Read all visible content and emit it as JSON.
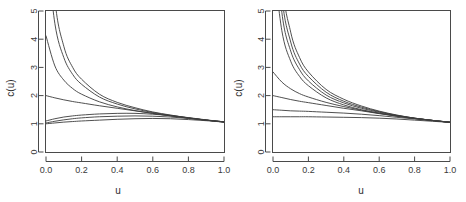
{
  "figure": {
    "background": "#ffffff",
    "curve_color": "#3c3c3c",
    "axis_color": "#4a4a4a",
    "panel_count": 2
  },
  "chart_data": [
    {
      "type": "line",
      "panel": "left",
      "title": "",
      "xlabel": "u",
      "ylabel": "c(u)",
      "xlim": [
        0.0,
        1.0
      ],
      "ylim": [
        0,
        5
      ],
      "xticks": [
        0.0,
        0.2,
        0.4,
        0.6,
        0.8,
        1.0
      ],
      "xticklabels": [
        "0.0",
        "0.2",
        "0.4",
        "0.6",
        "0.8",
        "1.0"
      ],
      "yticks": [
        0,
        1,
        2,
        3,
        4,
        5
      ],
      "yticklabels": [
        "0",
        "1",
        "2",
        "3",
        "4",
        "5"
      ],
      "grid": false,
      "legend": "none",
      "x": [
        0.0,
        0.05,
        0.1,
        0.15,
        0.2,
        0.3,
        0.4,
        0.5,
        0.6,
        0.7,
        0.8,
        0.9,
        1.0
      ],
      "series": [
        {
          "name": "curve-1",
          "values": [
            9.8,
            5.4,
            3.75,
            3.0,
            2.58,
            2.05,
            1.76,
            1.57,
            1.42,
            1.31,
            1.21,
            1.13,
            1.06
          ]
        },
        {
          "name": "curve-2",
          "values": [
            7.4,
            4.55,
            3.35,
            2.75,
            2.4,
            1.95,
            1.7,
            1.53,
            1.4,
            1.3,
            1.21,
            1.13,
            1.06
          ]
        },
        {
          "name": "curve-3",
          "values": [
            4.12,
            3.05,
            2.55,
            2.25,
            2.05,
            1.78,
            1.6,
            1.47,
            1.37,
            1.28,
            1.2,
            1.13,
            1.07
          ]
        },
        {
          "name": "curve-4",
          "values": [
            2.0,
            1.92,
            1.85,
            1.79,
            1.74,
            1.64,
            1.55,
            1.46,
            1.37,
            1.28,
            1.2,
            1.13,
            1.07
          ]
        },
        {
          "name": "curve-5",
          "values": [
            1.1,
            1.18,
            1.24,
            1.28,
            1.31,
            1.35,
            1.37,
            1.37,
            1.34,
            1.29,
            1.22,
            1.14,
            1.07
          ]
        },
        {
          "name": "curve-6",
          "values": [
            1.03,
            1.09,
            1.14,
            1.18,
            1.21,
            1.25,
            1.27,
            1.28,
            1.27,
            1.24,
            1.19,
            1.13,
            1.07
          ]
        },
        {
          "name": "curve-7",
          "values": [
            1.0,
            1.03,
            1.06,
            1.08,
            1.1,
            1.13,
            1.16,
            1.18,
            1.19,
            1.18,
            1.15,
            1.11,
            1.06
          ]
        }
      ]
    },
    {
      "type": "line",
      "panel": "right",
      "title": "",
      "xlabel": "u",
      "ylabel": "c(u)",
      "xlim": [
        0.0,
        1.0
      ],
      "ylim": [
        0,
        5
      ],
      "xticks": [
        0.0,
        0.2,
        0.4,
        0.6,
        0.8,
        1.0
      ],
      "xticklabels": [
        "0.0",
        "0.2",
        "0.4",
        "0.6",
        "0.8",
        "1.0"
      ],
      "yticks": [
        0,
        1,
        2,
        3,
        4,
        5
      ],
      "yticklabels": [
        "0",
        "1",
        "2",
        "3",
        "4",
        "5"
      ],
      "grid": false,
      "legend": "none",
      "x": [
        0.0,
        0.05,
        0.1,
        0.15,
        0.2,
        0.3,
        0.4,
        0.5,
        0.6,
        0.7,
        0.8,
        0.9,
        1.0
      ],
      "series": [
        {
          "name": "curve-1",
          "values": [
            12.0,
            6.2,
            4.25,
            3.35,
            2.84,
            2.22,
            1.87,
            1.63,
            1.45,
            1.31,
            1.2,
            1.12,
            1.05
          ]
        },
        {
          "name": "curve-2",
          "values": [
            10.2,
            5.55,
            3.9,
            3.12,
            2.68,
            2.12,
            1.8,
            1.59,
            1.43,
            1.3,
            1.2,
            1.12,
            1.05
          ]
        },
        {
          "name": "curve-3",
          "values": [
            8.6,
            4.95,
            3.58,
            2.92,
            2.52,
            2.02,
            1.74,
            1.55,
            1.41,
            1.29,
            1.2,
            1.12,
            1.05
          ]
        },
        {
          "name": "curve-4",
          "values": [
            6.9,
            4.3,
            3.22,
            2.68,
            2.35,
            1.92,
            1.67,
            1.5,
            1.38,
            1.28,
            1.19,
            1.12,
            1.05
          ]
        },
        {
          "name": "curve-5",
          "values": [
            2.84,
            2.48,
            2.24,
            2.07,
            1.95,
            1.76,
            1.61,
            1.48,
            1.37,
            1.27,
            1.19,
            1.12,
            1.06
          ]
        },
        {
          "name": "curve-6",
          "values": [
            2.0,
            1.93,
            1.86,
            1.8,
            1.75,
            1.65,
            1.55,
            1.46,
            1.36,
            1.27,
            1.19,
            1.12,
            1.06
          ]
        },
        {
          "name": "curve-7",
          "values": [
            1.5,
            1.48,
            1.46,
            1.45,
            1.44,
            1.41,
            1.38,
            1.34,
            1.29,
            1.23,
            1.17,
            1.11,
            1.06
          ]
        },
        {
          "name": "curve-8",
          "values": [
            1.25,
            1.25,
            1.25,
            1.25,
            1.25,
            1.24,
            1.23,
            1.22,
            1.2,
            1.17,
            1.13,
            1.09,
            1.05
          ]
        }
      ]
    }
  ]
}
